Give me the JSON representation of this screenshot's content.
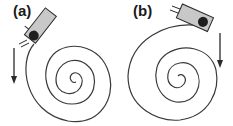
{
  "figure": {
    "panels": [
      {
        "id": "a",
        "label": "(a)",
        "arrow_direction": "down",
        "spiral_turns": 3,
        "device_position": "top-left, entering spiral at outer edge"
      },
      {
        "id": "b",
        "label": "(b)",
        "arrow_direction": "down",
        "spiral_turns": 3,
        "device_position": "top-right, on outer edge of spiral"
      }
    ],
    "colors": {
      "line": "#3a3a3a",
      "device_body": "#c8c8c8",
      "device_outline": "#2a2a2a",
      "ball": "#1e1e1e"
    }
  }
}
